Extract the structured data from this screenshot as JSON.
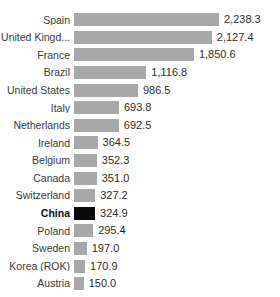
{
  "chart_data": {
    "type": "bar",
    "orientation": "horizontal",
    "title": "",
    "subtitle": "",
    "xlabel": "",
    "ylabel": "",
    "grid": false,
    "legend": null,
    "axis_visible": false,
    "xlim": [
      0,
      2238.3
    ],
    "bar_color": "#a8a8a8",
    "highlight_color": "#0a0a0a",
    "highlight_category": "China",
    "value_format": "comma-thousands-one-decimal",
    "categories": [
      "Spain",
      "United Kingd...",
      "France",
      "Brazil",
      "United States",
      "Italy",
      "Netherlands",
      "Ireland",
      "Belgium",
      "Canada",
      "Switzerland",
      "China",
      "Poland",
      "Sweden",
      "Korea (ROK)",
      "Austria"
    ],
    "values": [
      2238.3,
      2127.4,
      1850.6,
      1116.8,
      986.5,
      693.8,
      692.5,
      364.5,
      352.3,
      351.0,
      327.2,
      324.9,
      295.4,
      197.0,
      170.9,
      150.0
    ],
    "value_labels": [
      "2,238.3",
      "2,127.4",
      "1,850.6",
      "1,116.8",
      "986.5",
      "693.8",
      "692.5",
      "364.5",
      "352.3",
      "351.0",
      "327.2",
      "324.9",
      "295.4",
      "197.0",
      "170.9",
      "150.0"
    ]
  }
}
